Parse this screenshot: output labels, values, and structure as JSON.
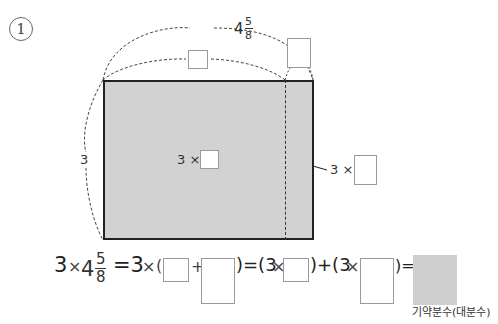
{
  "problem": {
    "number": "1",
    "diagram": {
      "top_length": {
        "whole": "4",
        "numerator": "5",
        "denominator": "8"
      },
      "side_length": "3",
      "inner_label_prefix": "3 ×",
      "strip_label_prefix": "3 ×"
    },
    "equation": {
      "lhs_factor": "3",
      "times": "×",
      "mixed": {
        "whole": "4",
        "numerator": "5",
        "denominator": "8"
      },
      "eq1": "=3",
      "open_paren": "(",
      "plus": "+",
      "close_eq_open": ")=(3",
      "close_plus_open": ")+(3",
      "close_eq": ")="
    },
    "answer_caption": "기약분수(대분수)"
  },
  "colors": {
    "shade": "#d2d2d2",
    "border": "#222222"
  }
}
